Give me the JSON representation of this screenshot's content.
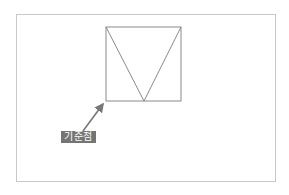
{
  "diagram": {
    "frame": {
      "border_color": "#c8c8c8"
    },
    "shape": {
      "square": {
        "x1": 106,
        "y1": 27,
        "x2": 181,
        "y2": 101
      },
      "triangle_apex_bottom": {
        "x": 144,
        "y": 101
      },
      "stroke_color": "#8a8a8a"
    },
    "annotation": {
      "label": "기준점",
      "label_bg": "#757575",
      "label_color": "#ffffff",
      "arrow_color": "#777777",
      "points_to": "bottom-left corner of square"
    }
  }
}
